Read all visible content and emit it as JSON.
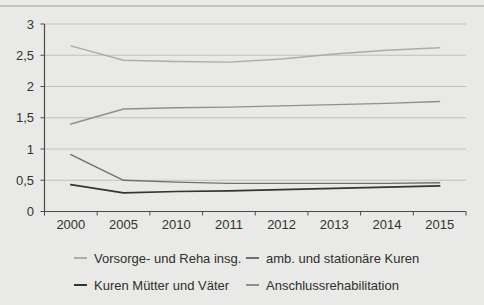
{
  "page": {
    "background": "#e9e9e7",
    "top_rule_color": "#c2c2c0"
  },
  "chart_data": {
    "type": "line",
    "categories": [
      "2000",
      "2005",
      "2010",
      "2011",
      "2012",
      "2013",
      "2014",
      "2015"
    ],
    "series": [
      {
        "name": "Vorsorge- und Reha insg.",
        "color": "#acacaa",
        "values": [
          2.65,
          2.42,
          2.4,
          2.39,
          2.44,
          2.52,
          2.58,
          2.62
        ]
      },
      {
        "name": "amb. und stationäre Kuren",
        "color": "#6f6f6d",
        "values": [
          0.91,
          0.5,
          0.47,
          0.45,
          0.45,
          0.45,
          0.45,
          0.46
        ]
      },
      {
        "name": "Kuren Mütter und Väter",
        "color": "#343432",
        "values": [
          0.43,
          0.3,
          0.32,
          0.33,
          0.35,
          0.37,
          0.39,
          0.41
        ]
      },
      {
        "name": "Anschlussrehabilitation",
        "color": "#8f8f8d",
        "values": [
          1.4,
          1.64,
          1.66,
          1.67,
          1.69,
          1.71,
          1.73,
          1.76
        ]
      }
    ],
    "title": "",
    "xlabel": "",
    "ylabel": "",
    "ylim": [
      0,
      3
    ],
    "y_tick_step": 0.5,
    "y_tick_labels": [
      "0",
      "0,5",
      "1",
      "1,5",
      "2",
      "2,5",
      "3"
    ],
    "grid": true,
    "legend_position": "bottom",
    "axis_color": "#4b4b49",
    "grid_color": "#c0c0be",
    "label_color": "#33332f"
  }
}
